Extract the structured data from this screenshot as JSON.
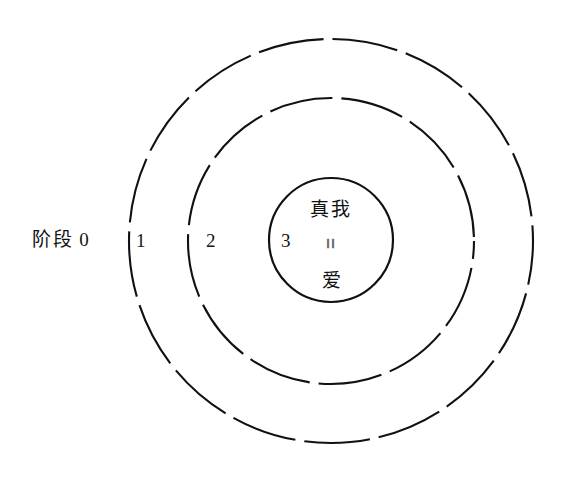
{
  "diagram": {
    "type": "concentric-circles",
    "background_color": "#ffffff",
    "stroke_color": "#111111",
    "stage_label": "阶段 0",
    "rings": [
      {
        "number": "1",
        "style": "dashed",
        "radius": 202
      },
      {
        "number": "2",
        "style": "dashed",
        "radius": 143
      },
      {
        "number": "3",
        "style": "solid",
        "radius": 62
      }
    ],
    "center": {
      "line_1": "真我",
      "equals_glyph": "=",
      "line_2": "爱"
    }
  }
}
